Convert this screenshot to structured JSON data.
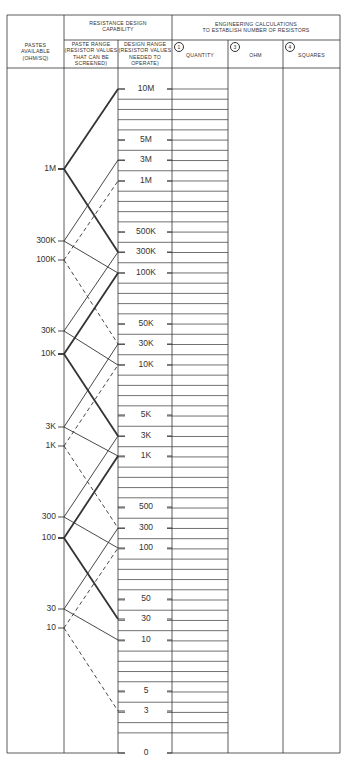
{
  "headers": {
    "pastes_available": [
      "PASTES",
      "AVAILABLE",
      "(OHM/SQ)"
    ],
    "resistance_design": [
      "RESISTANCE DESIGN",
      "CAPABILITY"
    ],
    "paste_range": [
      "PASTE RANGE",
      "(RESISTOR VALUES",
      "THAT CAN BE",
      "SCREENED)"
    ],
    "design_range": [
      "DESIGN RANGE",
      "(RESISTOR VALUES",
      "NEEDED TO",
      "OPERATE)"
    ],
    "engineering": [
      "ENGINEERING CALCULATIONS",
      "TO ESTABLISH NUMBER OF RESISTORS"
    ],
    "quantity": {
      "num": "1",
      "label": "QUANTITY"
    },
    "ohm": {
      "num": "3",
      "label": "OHM"
    },
    "squares": {
      "num": "4",
      "label": "SQUARES"
    }
  },
  "layout": {
    "cols": [
      7,
      64,
      118,
      172,
      228,
      283,
      340
    ],
    "top": 15,
    "header_split": 40,
    "header_bottom": 68,
    "bottom": 753,
    "row_start": 89,
    "row_step": 10.22,
    "row_lines_until": 733
  },
  "paste_values": [
    {
      "label": "1M",
      "y": 169,
      "style": "thick"
    },
    {
      "label": "300K",
      "y": 241,
      "style": "thin"
    },
    {
      "label": "100K",
      "y": 260,
      "style": "dashed"
    },
    {
      "label": "30K",
      "y": 331,
      "style": "thin"
    },
    {
      "label": "10K",
      "y": 354,
      "style": "thick"
    },
    {
      "label": "3K",
      "y": 427,
      "style": "thin"
    },
    {
      "label": "1K",
      "y": 446,
      "style": "dashed"
    },
    {
      "label": "300",
      "y": 517,
      "style": "thin"
    },
    {
      "label": "100",
      "y": 538,
      "style": "thick"
    },
    {
      "label": "30",
      "y": 609,
      "style": "thin"
    },
    {
      "label": "10",
      "y": 628,
      "style": "dashed"
    }
  ],
  "design_values": [
    {
      "label": "10M",
      "y": 89
    },
    {
      "label": "5M",
      "y": 140
    },
    {
      "label": "3M",
      "y": 160
    },
    {
      "label": "1M",
      "y": 181
    },
    {
      "label": "500K",
      "y": 232
    },
    {
      "label": "300K",
      "y": 252
    },
    {
      "label": "100K",
      "y": 273
    },
    {
      "label": "50K",
      "y": 324
    },
    {
      "label": "30K",
      "y": 344
    },
    {
      "label": "10K",
      "y": 365
    },
    {
      "label": "5K",
      "y": 415
    },
    {
      "label": "3K",
      "y": 436
    },
    {
      "label": "1K",
      "y": 456
    },
    {
      "label": "500",
      "y": 507
    },
    {
      "label": "300",
      "y": 528
    },
    {
      "label": "100",
      "y": 548
    },
    {
      "label": "50",
      "y": 599
    },
    {
      "label": "30",
      "y": 619
    },
    {
      "label": "10",
      "y": 640
    },
    {
      "label": "5",
      "y": 691
    },
    {
      "label": "3",
      "y": 711
    },
    {
      "label": "0",
      "y": 753
    }
  ],
  "connections": [
    {
      "from": "1M",
      "to_up": "10M",
      "to_down": "300K",
      "style": "thick"
    },
    {
      "from": "300K",
      "to_up": "3M",
      "to_down": "100K",
      "style": "thin"
    },
    {
      "from": "100K",
      "to_up": "1M",
      "to_down": "30K",
      "style": "dashed"
    },
    {
      "from": "30K",
      "to_up": "300K",
      "to_down": "10K",
      "style": "thin"
    },
    {
      "from": "10K",
      "to_up": "100K",
      "to_down": "3K",
      "style": "thick"
    },
    {
      "from": "3K",
      "to_up": "30K",
      "to_down": "1K",
      "style": "thin"
    },
    {
      "from": "1K",
      "to_up": "10K",
      "to_down": "300",
      "style": "dashed"
    },
    {
      "from": "300",
      "to_up": "3K",
      "to_down": "100",
      "style": "thin"
    },
    {
      "from": "100",
      "to_up": "1K",
      "to_down": "30",
      "style": "thick"
    },
    {
      "from": "30",
      "to_up": "300",
      "to_down": "10",
      "style": "thin"
    },
    {
      "from": "10",
      "to_up": "100",
      "to_down": "3",
      "style": "dashed"
    }
  ],
  "colors": {
    "line": "#333333",
    "grid": "#555555",
    "background": "#ffffff"
  }
}
